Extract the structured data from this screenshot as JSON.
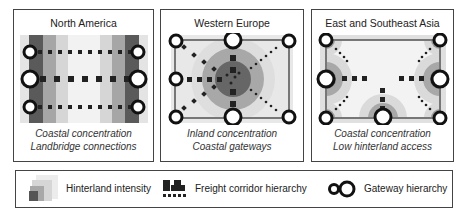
{
  "panels": [
    {
      "title": "North America",
      "caption_line1": "Coastal concentration",
      "caption_line2": "Landbridge connections"
    },
    {
      "title": "Western Europe",
      "caption_line1": "Inland concentration",
      "caption_line2": "Coastal gateways"
    },
    {
      "title": "East and Southeast Asia",
      "caption_line1": "Coastal concentration",
      "caption_line2": "Low hinterland access"
    }
  ],
  "legend": {
    "hinterland": {
      "label": "Hinterland intensity",
      "icon": "hinterland-gradient-icon"
    },
    "corridor": {
      "label": "Freight corridor hierarchy",
      "icon": "corridor-bars-icon"
    },
    "gateway": {
      "label": "Gateway hierarchy",
      "icon": "gateway-circles-icon"
    }
  },
  "colors": {
    "dark": "#555555",
    "mid": "#9a9a9a",
    "light": "#cfcfcf",
    "lighter": "#e6e6e6",
    "lightest": "#f4f4f4",
    "border": "#444444"
  }
}
